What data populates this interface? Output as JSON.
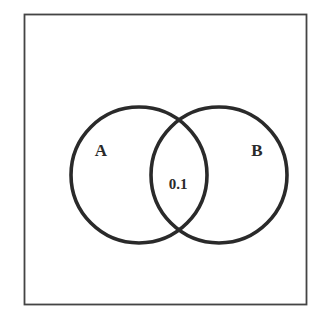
{
  "diagram": {
    "type": "venn",
    "sets": [
      {
        "name": "A",
        "label": "A"
      },
      {
        "name": "B",
        "label": "B"
      }
    ],
    "intersection": {
      "sets": [
        "A",
        "B"
      ],
      "value": "0.1"
    },
    "colors": {
      "stroke": "#2a2a2a",
      "frame": "#444444",
      "background": "#ffffff"
    }
  }
}
